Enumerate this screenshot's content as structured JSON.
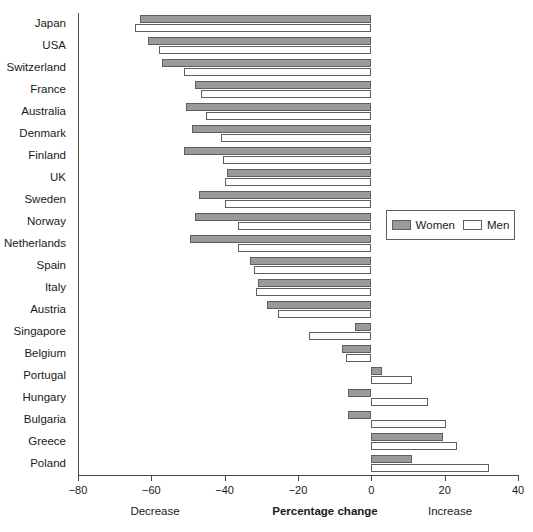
{
  "chart_data": {
    "type": "bar",
    "orientation": "horizontal",
    "title": "",
    "xlabel": "Percentage change",
    "ylabel": "",
    "xlim": [
      -80,
      40
    ],
    "xticks": [
      -80,
      -60,
      -40,
      -20,
      0,
      20,
      40
    ],
    "xticklabels": [
      "−80",
      "−60",
      "−40",
      "−20",
      "0",
      "20",
      "40"
    ],
    "grid": false,
    "legend_position": "center-right",
    "annotations": {
      "left_caption": "Decrease",
      "center_caption": "Percentage change",
      "right_caption": "Increase"
    },
    "categories": [
      "Japan",
      "USA",
      "Switzerland",
      "France",
      "Australia",
      "Denmark",
      "Finland",
      "UK",
      "Sweden",
      "Norway",
      "Netherlands",
      "Spain",
      "Italy",
      "Austria",
      "Singapore",
      "Belgium",
      "Portugal",
      "Hungary",
      "Bulgaria",
      "Greece",
      "Poland"
    ],
    "series": [
      {
        "name": "Women",
        "color": "#9a9a9a",
        "values": [
          -63,
          -61,
          -57,
          -48,
          -50.5,
          -49,
          -51,
          -39.5,
          -47,
          -48,
          -49.5,
          -33,
          -31,
          -28.5,
          -4.5,
          -8,
          3,
          -6.5,
          -6.5,
          19.5,
          11
        ]
      },
      {
        "name": "Men",
        "color": "#ffffff",
        "values": [
          -64.5,
          -58,
          -51,
          -46.5,
          -45,
          -41,
          -40.5,
          -40,
          -40,
          -36.5,
          -36.5,
          -32,
          -31.5,
          -25.5,
          -17,
          -7,
          11,
          15.5,
          20.5,
          23.5,
          32
        ]
      }
    ]
  },
  "legend": {
    "items": [
      {
        "label": "Women",
        "swatch": "filled-gray"
      },
      {
        "label": "Men",
        "swatch": "open-white"
      }
    ]
  }
}
